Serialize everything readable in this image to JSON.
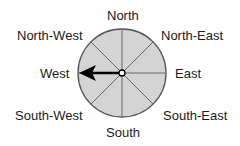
{
  "compass": {
    "labels": {
      "north": "North",
      "north_east": "North-East",
      "east": "East",
      "south_east": "South-East",
      "south": "South",
      "south_west": "South-West",
      "west": "West",
      "north_west": "North-West"
    },
    "arrow_direction": "West",
    "colors": {
      "dial_fill": "#d4d4d4",
      "dial_stroke": "#555555",
      "arrow": "#000000"
    }
  }
}
